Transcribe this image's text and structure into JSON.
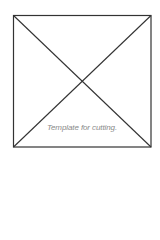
{
  "diagram": {
    "type": "square-with-diagonals",
    "caption": "Template for cutting.",
    "stroke_color": "#333333",
    "caption_color": "#8a8a8a",
    "square": {
      "left": 13,
      "top": 15,
      "right": 151,
      "bottom": 147
    }
  }
}
